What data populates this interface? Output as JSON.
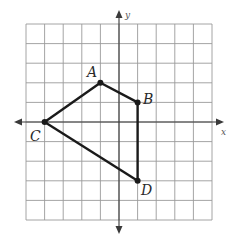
{
  "diagram": {
    "type": "coordinate-plane-polygon",
    "grid": {
      "x_min": -5,
      "x_max": 5,
      "y_min": -5,
      "y_max": 5,
      "step": 1
    },
    "axes": {
      "x_label": "x",
      "y_label": "y"
    },
    "vertices": [
      {
        "label": "A",
        "x": -1,
        "y": 2
      },
      {
        "label": "B",
        "x": 1,
        "y": 1
      },
      {
        "label": "D",
        "x": 1,
        "y": -3
      },
      {
        "label": "C",
        "x": -4,
        "y": 0
      }
    ],
    "edges": [
      [
        "A",
        "B"
      ],
      [
        "B",
        "D"
      ],
      [
        "D",
        "C"
      ],
      [
        "C",
        "A"
      ]
    ],
    "colors": {
      "grid": "#9a9a9a",
      "axis": "#3a3a3a",
      "polygon": "#1a1a1a"
    }
  }
}
